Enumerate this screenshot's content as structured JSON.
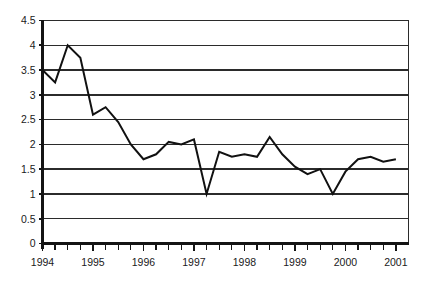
{
  "chart_data": {
    "type": "line",
    "title": "",
    "subtitle": "",
    "xlabel": "",
    "ylabel": "",
    "ylim": [
      0,
      4.5
    ],
    "xlim": [
      1994,
      2001.25
    ],
    "grid": true,
    "legend": false,
    "legend_position": "none",
    "y_ticks": [
      "0",
      "0.5",
      "1",
      "1.5",
      "2",
      "2.5",
      "3",
      "3.5",
      "4",
      "4.5"
    ],
    "y_tick_values": [
      0,
      0.5,
      1,
      1.5,
      2,
      2.5,
      3,
      3.5,
      4,
      4.5
    ],
    "x_tick_labels": [
      "1994",
      "1995",
      "1996",
      "1997",
      "1998",
      "1999",
      "2000",
      "2001"
    ],
    "x_tick_values": [
      1994,
      1995,
      1996,
      1997,
      1998,
      1999,
      2000,
      2001
    ],
    "minor_ticks_per_year": 4,
    "series": [
      {
        "name": "series-1",
        "color": "#111111",
        "x": [
          1994.0,
          1994.25,
          1994.5,
          1994.75,
          1995.0,
          1995.25,
          1995.5,
          1995.75,
          1996.0,
          1996.25,
          1996.5,
          1996.75,
          1997.0,
          1997.25,
          1997.5,
          1997.75,
          1998.0,
          1998.25,
          1998.5,
          1998.75,
          1999.0,
          1999.25,
          1999.5,
          1999.75,
          2000.0,
          2000.25,
          2000.5,
          2000.75,
          2001.0
        ],
        "values": [
          3.5,
          3.25,
          4.0,
          3.75,
          2.6,
          2.75,
          2.45,
          2.0,
          1.7,
          1.8,
          2.05,
          2.0,
          2.1,
          1.0,
          1.85,
          1.75,
          1.8,
          1.75,
          2.15,
          1.8,
          1.55,
          1.4,
          1.5,
          1.0,
          1.45,
          1.7,
          1.75,
          1.65,
          1.7
        ]
      }
    ]
  }
}
